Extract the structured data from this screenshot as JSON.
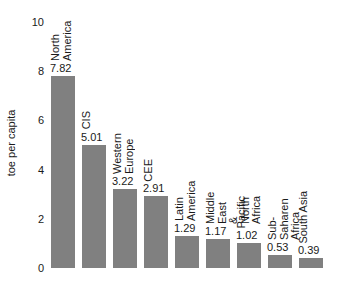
{
  "chart_data": {
    "type": "bar",
    "title": "",
    "xlabel": "",
    "ylabel": "toe per capita",
    "ylim": [
      0,
      10
    ],
    "yticks": [
      "0",
      "2",
      "4",
      "6",
      "8",
      "10"
    ],
    "grid": false,
    "legend": null,
    "bar_color": "#808080",
    "categories": [
      "North America",
      "CIS",
      "Western Europe",
      "CEE",
      "Latin America",
      "Middle East & North Africa",
      "Pacific",
      "Sub-Saharen Africa",
      "South Asia",
      "WORLD"
    ],
    "values": [
      7.82,
      5.01,
      3.22,
      2.91,
      1.29,
      1.17,
      1.02,
      0.53,
      0.39,
      1.66
    ],
    "value_labels": [
      "7.82",
      "5.01",
      "3.22",
      "2.91",
      "1.29",
      "1.17",
      "1.02",
      "0.53",
      "0.39",
      "1.66"
    ],
    "slots": [
      0,
      1,
      2,
      3,
      4,
      5,
      6,
      7,
      8,
      10
    ]
  }
}
